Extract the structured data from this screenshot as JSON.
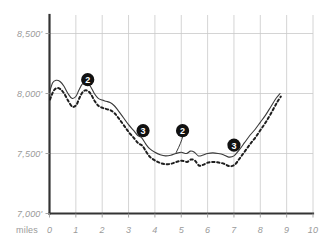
{
  "chart_data": {
    "type": "line",
    "title": "",
    "subtitle": "",
    "xlabel": "miles",
    "ylabel": "",
    "xlim": [
      0,
      10
    ],
    "ylim": [
      7000,
      8500
    ],
    "grid": true,
    "legend": "none",
    "x_ticks": [
      "0",
      "1",
      "2",
      "3",
      "4",
      "5",
      "6",
      "7",
      "8",
      "9",
      "10"
    ],
    "x_tick_values": [
      0,
      1,
      2,
      3,
      4,
      5,
      6,
      7,
      8,
      9,
      10
    ],
    "y_ticks": [
      "7,000'",
      "7,500'",
      "8,000'",
      "8,500'"
    ],
    "y_tick_values": [
      7000,
      7500,
      8000,
      8500
    ],
    "series": [
      {
        "name": "upper-trail-solid",
        "style": "solid",
        "color": "#3a3a3a",
        "x": [
          0.0,
          0.12,
          0.25,
          0.4,
          0.55,
          0.7,
          0.85,
          1.0,
          1.12,
          1.25,
          1.4,
          1.55,
          1.7,
          1.85,
          2.0,
          2.15,
          2.3,
          2.45,
          2.6,
          2.8,
          3.0,
          3.2,
          3.35,
          3.5,
          3.65,
          3.8,
          4.0,
          4.2,
          4.4,
          4.6,
          4.8,
          5.0,
          5.2,
          5.35,
          5.5,
          5.65,
          5.8,
          6.0,
          6.2,
          6.4,
          6.6,
          6.8,
          7.0,
          7.2,
          7.4,
          7.6,
          7.8,
          8.0,
          8.2,
          8.4,
          8.6,
          8.75
        ],
        "y": [
          8010,
          8090,
          8110,
          8100,
          8060,
          8000,
          7960,
          7975,
          8030,
          8080,
          8090,
          8060,
          8000,
          7960,
          7945,
          7935,
          7925,
          7900,
          7860,
          7800,
          7740,
          7690,
          7650,
          7630,
          7580,
          7540,
          7510,
          7490,
          7480,
          7485,
          7500,
          7510,
          7500,
          7520,
          7510,
          7480,
          7485,
          7500,
          7505,
          7500,
          7490,
          7470,
          7480,
          7530,
          7590,
          7650,
          7700,
          7760,
          7820,
          7890,
          7960,
          8000
        ]
      },
      {
        "name": "lower-trail-dashed",
        "style": "dashed",
        "color": "#1e1e1e",
        "x": [
          0.02,
          0.15,
          0.28,
          0.42,
          0.57,
          0.72,
          0.87,
          1.02,
          1.14,
          1.27,
          1.42,
          1.57,
          1.72,
          1.87,
          2.02,
          2.17,
          2.32,
          2.47,
          2.62,
          2.82,
          3.02,
          3.22,
          3.37,
          3.52,
          3.67,
          3.82,
          4.02,
          4.22,
          4.42,
          4.62,
          4.82,
          5.02,
          5.22,
          5.37,
          5.52,
          5.67,
          5.82,
          6.02,
          6.22,
          6.42,
          6.62,
          6.82,
          7.02,
          7.22,
          7.42,
          7.62,
          7.82,
          8.02,
          8.22,
          8.42,
          8.62,
          8.78
        ],
        "y": [
          7950,
          8020,
          8045,
          8035,
          7995,
          7935,
          7890,
          7905,
          7965,
          8015,
          8025,
          7995,
          7935,
          7895,
          7880,
          7870,
          7860,
          7835,
          7795,
          7735,
          7675,
          7625,
          7585,
          7565,
          7515,
          7470,
          7440,
          7420,
          7410,
          7415,
          7430,
          7440,
          7430,
          7450,
          7440,
          7400,
          7405,
          7425,
          7430,
          7425,
          7415,
          7395,
          7405,
          7460,
          7520,
          7580,
          7635,
          7700,
          7765,
          7840,
          7920,
          7975
        ]
      }
    ],
    "annotations": [
      {
        "label": "2",
        "mile": 1.45,
        "elevation": 8115,
        "has_leader": false
      },
      {
        "label": "3",
        "mile": 3.55,
        "elevation": 7690,
        "has_leader": false
      },
      {
        "label": "2",
        "mile": 5.05,
        "elevation": 7690,
        "has_leader": true,
        "leader_to_mile": 4.8,
        "leader_to_elevation": 7505
      },
      {
        "label": "3",
        "mile": 7.0,
        "elevation": 7570,
        "has_leader": false
      }
    ]
  }
}
